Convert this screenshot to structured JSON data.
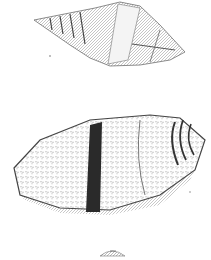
{
  "plate": {
    "background": "#ffffff",
    "figures": [
      {
        "name": "shell-upper",
        "description": "Elongated spired shell, dorsal view, pale banded"
      },
      {
        "name": "shell-middle",
        "description": "Large fusiform shell with dark vertical band and striped apex"
      },
      {
        "name": "shell-lower",
        "description": "Small partial shell apex at bottom"
      }
    ],
    "labels": [
      "",
      ""
    ],
    "colors": {
      "ink": "#3a3a3a",
      "band": "#2a2a2a",
      "shade": "#8a8a8a"
    }
  }
}
